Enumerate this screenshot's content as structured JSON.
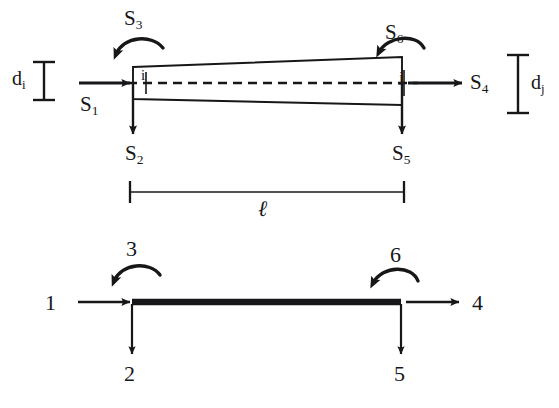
{
  "figure": {
    "ink_color": "#17171a",
    "background_color": "#ffffff",
    "top_diagram": {
      "name": "force-notation-diagram",
      "node_i_label": "i",
      "node_j_label": "j",
      "depth_left": {
        "symbol": "d",
        "subscript": "i"
      },
      "depth_right": {
        "symbol": "d",
        "subscript": "j"
      },
      "length_label": "ℓ",
      "forces": [
        {
          "id": "S1",
          "symbol": "S",
          "subscript": "1",
          "kind": "axial-force",
          "direction": "right",
          "at_node": "i"
        },
        {
          "id": "S2",
          "symbol": "S",
          "subscript": "2",
          "kind": "shear-force",
          "direction": "down",
          "at_node": "i"
        },
        {
          "id": "S3",
          "symbol": "S",
          "subscript": "3",
          "kind": "moment",
          "direction": "counterclockwise",
          "at_node": "i"
        },
        {
          "id": "S4",
          "symbol": "S",
          "subscript": "4",
          "kind": "axial-force",
          "direction": "right",
          "at_node": "j"
        },
        {
          "id": "S5",
          "symbol": "S",
          "subscript": "5",
          "kind": "shear-force",
          "direction": "down",
          "at_node": "j"
        },
        {
          "id": "S6",
          "symbol": "S",
          "subscript": "6",
          "kind": "moment",
          "direction": "counterclockwise",
          "at_node": "j"
        }
      ]
    },
    "bottom_diagram": {
      "name": "dof-numbering-diagram",
      "dofs": [
        {
          "id": "dof1",
          "label": "1",
          "kind": "axial-displacement",
          "direction": "right",
          "end": "left"
        },
        {
          "id": "dof2",
          "label": "2",
          "kind": "transverse-displacement",
          "direction": "down",
          "end": "left"
        },
        {
          "id": "dof3",
          "label": "3",
          "kind": "rotation",
          "direction": "counterclockwise",
          "end": "left"
        },
        {
          "id": "dof4",
          "label": "4",
          "kind": "axial-displacement",
          "direction": "right",
          "end": "right"
        },
        {
          "id": "dof5",
          "label": "5",
          "kind": "transverse-displacement",
          "direction": "down",
          "end": "right"
        },
        {
          "id": "dof6",
          "label": "6",
          "kind": "rotation",
          "direction": "counterclockwise",
          "end": "right"
        }
      ]
    }
  }
}
